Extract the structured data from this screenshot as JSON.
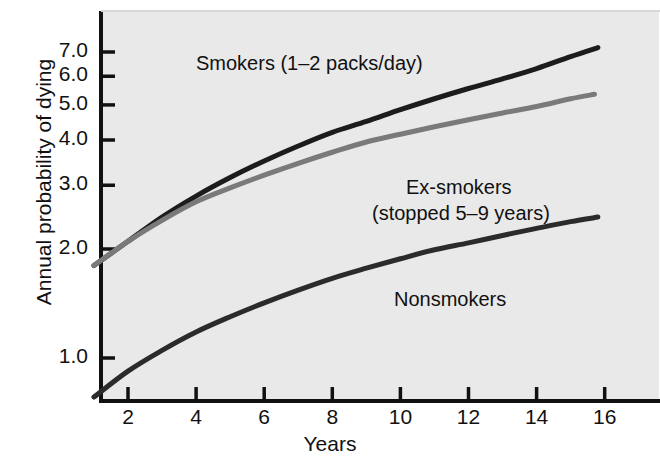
{
  "chart_data": {
    "type": "line",
    "title": "",
    "xlabel": "Years",
    "ylabel": "Annual probability of dying",
    "xlim": [
      1,
      16
    ],
    "ylim": [
      0.7,
      7.6
    ],
    "yscale": "log",
    "grid": false,
    "legend_position": "inline-annotations",
    "xticks": [
      2,
      4,
      6,
      8,
      10,
      12,
      14,
      16
    ],
    "xtick_labels": [
      "2",
      "4",
      "6",
      "8",
      "10",
      "12",
      "14",
      "16"
    ],
    "yticks": [
      1.0,
      2.0,
      3.0,
      4.0,
      5.0,
      6.0,
      7.0
    ],
    "ytick_labels": [
      "1.0",
      "2.0",
      "3.0",
      "4.0",
      "5.0",
      "6.0",
      "7.0"
    ],
    "series": [
      {
        "name": "Smokers (1–2 packs/day)",
        "color": "#1c1c1c",
        "x": [
          1,
          2,
          3,
          4,
          5,
          6,
          7,
          8,
          9,
          10,
          11,
          12,
          13,
          14,
          15,
          15.8
        ],
        "values": [
          1.8,
          2.1,
          2.45,
          2.8,
          3.15,
          3.5,
          3.85,
          4.2,
          4.5,
          4.85,
          5.2,
          5.55,
          5.9,
          6.3,
          6.8,
          7.2
        ]
      },
      {
        "name": "Ex-smokers (stopped 5–9 years)",
        "color": "#7a7a7a",
        "x": [
          1,
          2,
          3,
          4,
          5,
          6,
          7,
          8,
          9,
          10,
          11,
          12,
          13,
          14,
          15,
          15.7
        ],
        "values": [
          1.8,
          2.1,
          2.4,
          2.7,
          2.95,
          3.2,
          3.45,
          3.7,
          3.95,
          4.15,
          4.35,
          4.55,
          4.75,
          4.95,
          5.2,
          5.35
        ]
      },
      {
        "name": "Nonsmokers",
        "color": "#2b2b2b",
        "x": [
          1,
          2,
          3,
          4,
          5,
          6,
          7,
          8,
          9,
          10,
          11,
          12,
          13,
          14,
          15,
          15.8
        ],
        "values": [
          0.78,
          0.92,
          1.05,
          1.18,
          1.3,
          1.42,
          1.54,
          1.66,
          1.77,
          1.88,
          1.99,
          2.08,
          2.18,
          2.28,
          2.38,
          2.45
        ]
      }
    ],
    "annotations": [
      {
        "text": "Smokers (1–2 packs/day)",
        "x_px": 196,
        "y_px": 52
      },
      {
        "text": "Ex-smokers",
        "x_px": 406,
        "y_px": 175
      },
      {
        "text": "(stopped 5–9 years)",
        "x_px": 374,
        "y_px": 201
      },
      {
        "text": "Nonsmokers",
        "x_px": 395,
        "y_px": 288
      }
    ],
    "colors": {
      "plot_background": "#e9e9e9",
      "page_background": "#ffffff",
      "axis": "#111111",
      "smokers": "#1c1c1c",
      "ex_smokers": "#7a7a7a",
      "nonsmokers": "#2b2b2b"
    }
  },
  "axes": {
    "ylabel": "Annual probability of dying",
    "xlabel": "Years",
    "ytick_labels": [
      "7.0",
      "6.0",
      "5.0",
      "4.0",
      "3.0",
      "2.0",
      "1.0"
    ],
    "xtick_labels": [
      "2",
      "4",
      "6",
      "8",
      "10",
      "12",
      "14",
      "16"
    ]
  },
  "annotations": {
    "smokers": "Smokers (1–2 packs/day)",
    "ex_smokers_line1": "Ex-smokers",
    "ex_smokers_line2": "(stopped 5–9 years)",
    "nonsmokers": "Nonsmokers"
  }
}
